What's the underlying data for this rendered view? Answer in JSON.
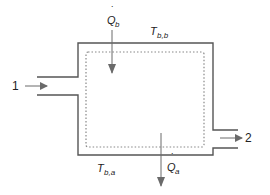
{
  "diagram": {
    "type": "control-volume",
    "inlet_label": "1",
    "outlet_label": "2",
    "heat_in": {
      "symbol": "Q",
      "subscript": "b",
      "dot": "˙"
    },
    "heat_out": {
      "symbol": "Q",
      "subscript": "a",
      "dot": "˙"
    },
    "temp_top": {
      "symbol": "T",
      "subscript": "b,b"
    },
    "temp_bottom": {
      "symbol": "T",
      "subscript": "b,a"
    },
    "colors": {
      "wall": "#555555",
      "boundary_dotted": "#888888",
      "arrow": "#6a6a6a",
      "text": "#222222"
    }
  }
}
